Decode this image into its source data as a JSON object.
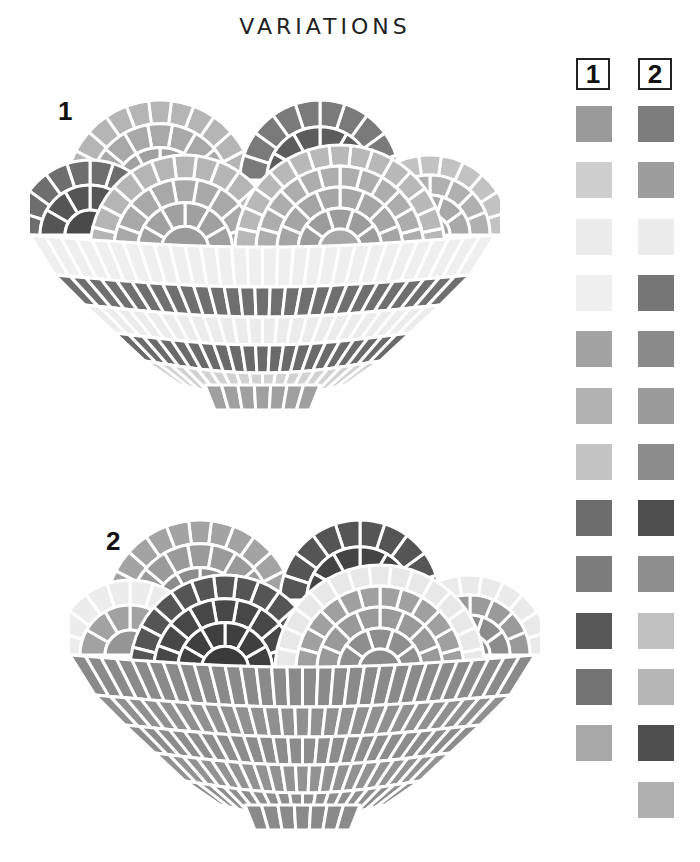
{
  "title": "VARIATIONS",
  "variations": [
    {
      "label": "1"
    },
    {
      "label": "2"
    }
  ],
  "palette": {
    "columns": [
      {
        "label": "1",
        "swatches": [
          "#9a9a9a",
          "#cfcfcf",
          "#ececec",
          "#efefef",
          "#a3a3a3",
          "#b2b2b2",
          "#c4c4c4",
          "#6d6d6d",
          "#7c7c7c",
          "#585858",
          "#737373",
          "#a8a8a8"
        ]
      },
      {
        "label": "2",
        "swatches": [
          "#7d7d7d",
          "#9c9c9c",
          "#ececec",
          "#767676",
          "#8a8a8a",
          "#9a9a9a",
          "#8c8c8c",
          "#4e4e4e",
          "#8e8e8e",
          "#c0c0c0",
          "#b5b5b5",
          "#4f4f4f",
          "#b0b0b0"
        ]
      }
    ]
  },
  "colors": {
    "background": "#ffffff",
    "grout": "#ffffff",
    "text": "#111111"
  }
}
